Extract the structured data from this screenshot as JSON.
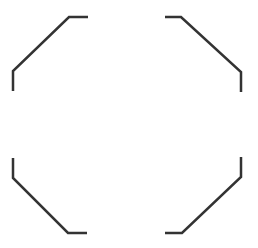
{
  "canvas": {
    "width": 258,
    "height": 248,
    "background": "#ffffff"
  },
  "stroke": {
    "color": "#333333",
    "width": 2.5
  },
  "shape": "octagonal-corner-brackets",
  "brackets": [
    {
      "name": "top-left",
      "points": "13,91 13,71 69,17 88,17"
    },
    {
      "name": "top-right",
      "points": "165,17 181,17 241,72 241,92"
    },
    {
      "name": "bottom-left",
      "points": "13,158 13,178 68,233 87,233"
    },
    {
      "name": "bottom-right",
      "points": "165,233 182,233 241,177 241,157"
    }
  ]
}
